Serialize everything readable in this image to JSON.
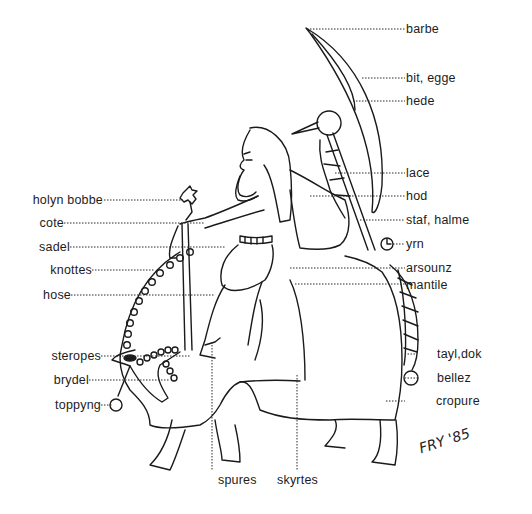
{
  "diagram": {
    "signature": "FRY '85",
    "colors": {
      "ink": "#1a1a1a",
      "background": "#ffffff"
    },
    "labels_right": [
      {
        "id": "barbe",
        "text": "barbe",
        "y": 28
      },
      {
        "id": "bit-egge",
        "text": "bit, egge",
        "y": 77
      },
      {
        "id": "hede",
        "text": "hede",
        "y": 100
      },
      {
        "id": "lace",
        "text": "lace",
        "y": 172
      },
      {
        "id": "hod",
        "text": "hod",
        "y": 195
      },
      {
        "id": "staf-halme",
        "text": "staf, halme",
        "y": 219
      },
      {
        "id": "yrn",
        "text": "yrn",
        "y": 243
      },
      {
        "id": "arsounz",
        "text": "arsounz",
        "y": 267
      },
      {
        "id": "mantile",
        "text": "mantile",
        "y": 284
      },
      {
        "id": "tayl-dok",
        "text": "tayl,dok",
        "y": 353
      },
      {
        "id": "bellez",
        "text": "bellez",
        "y": 377
      },
      {
        "id": "cropure",
        "text": "cropure",
        "y": 400
      }
    ],
    "labels_left": [
      {
        "id": "holyn-bobbe",
        "text": "holyn bobbe",
        "y": 199
      },
      {
        "id": "cote",
        "text": "cote",
        "y": 222
      },
      {
        "id": "sadel",
        "text": "sadel",
        "y": 246
      },
      {
        "id": "knottes",
        "text": "knottes",
        "y": 269
      },
      {
        "id": "hose",
        "text": "hose",
        "y": 294
      },
      {
        "id": "steropes",
        "text": "steropes",
        "y": 355
      },
      {
        "id": "brydel",
        "text": "brydel",
        "y": 379
      },
      {
        "id": "toppyng",
        "text": "toppyng",
        "y": 404
      }
    ],
    "labels_bottom": [
      {
        "id": "spures",
        "text": "spures",
        "x": 218
      },
      {
        "id": "skyrtes",
        "text": "skyrtes",
        "x": 277
      }
    ]
  }
}
